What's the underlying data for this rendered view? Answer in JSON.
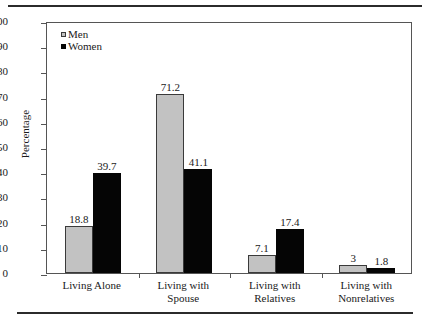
{
  "chart_data": {
    "type": "bar",
    "title": "",
    "xlabel": "",
    "ylabel": "Percentage",
    "ylim": [
      0,
      100
    ],
    "ytick_step": 10,
    "yticks": [
      0,
      10,
      20,
      30,
      40,
      50,
      60,
      70,
      80,
      90,
      100
    ],
    "grid": false,
    "legend_position": "top-left",
    "categories": [
      "Living Alone",
      "Living with Spouse",
      "Living with Relatives",
      "Living with Nonrelatives"
    ],
    "category_lines": [
      [
        "Living Alone"
      ],
      [
        "Living with",
        "Spouse"
      ],
      [
        "Living with",
        "Relatives"
      ],
      [
        "Living with",
        "Nonrelatives"
      ]
    ],
    "series": [
      {
        "name": "Men",
        "color": "#c2c2c2",
        "values": [
          18.8,
          71.2,
          7.1,
          3
        ],
        "labels": [
          "18.8",
          "71.2",
          "7.1",
          "3"
        ]
      },
      {
        "name": "Women",
        "color": "#050505",
        "values": [
          39.7,
          41.1,
          17.4,
          1.8
        ],
        "labels": [
          "39.7",
          "41.1",
          "17.4",
          "1.8"
        ]
      }
    ]
  },
  "legend": {
    "items": [
      {
        "label": "Men",
        "swatch": "legend-swatch-men"
      },
      {
        "label": "Women",
        "swatch": "legend-swatch-women"
      }
    ]
  },
  "axis": {
    "y_title": "Percentage",
    "y_labels": [
      "100",
      "90",
      "80",
      "70",
      "60",
      "50",
      "40",
      "30",
      "20",
      "10",
      "0"
    ]
  }
}
